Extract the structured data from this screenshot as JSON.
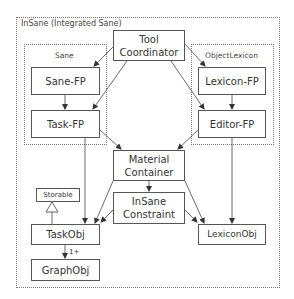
{
  "diagram": {
    "containers": {
      "outer": {
        "label": "InSane (Integrated Sane)"
      },
      "sane": {
        "label": "Sane"
      },
      "object_lexicon": {
        "label": "ObjectLexicon"
      }
    },
    "nodes": {
      "tool_coordinator": {
        "line1": "Tool",
        "line2": "Coordinator"
      },
      "sane_fp": {
        "label": "Sane-FP"
      },
      "task_fp": {
        "label": "Task-FP"
      },
      "lexicon_fp": {
        "label": "Lexicon-FP"
      },
      "editor_fp": {
        "label": "Editor-FP"
      },
      "material_container": {
        "line1": "Material",
        "line2": "Container"
      },
      "insane_constraint": {
        "line1": "InSane",
        "line2": "Constraint"
      },
      "storable": {
        "label": "Storable"
      },
      "task_obj": {
        "label": "TaskObj"
      },
      "graph_obj": {
        "label": "GraphObj"
      },
      "lexicon_obj": {
        "label": "LexiconObj"
      }
    },
    "edges": [
      {
        "from": "Tool Coordinator",
        "to": "Sane-FP"
      },
      {
        "from": "Tool Coordinator",
        "to": "Task-FP"
      },
      {
        "from": "Tool Coordinator",
        "to": "Lexicon-FP"
      },
      {
        "from": "Tool Coordinator",
        "to": "Editor-FP"
      },
      {
        "from": "Sane-FP",
        "to": "Task-FP"
      },
      {
        "from": "Lexicon-FP",
        "to": "Editor-FP"
      },
      {
        "from": "Task-FP",
        "to": "Material Container"
      },
      {
        "from": "Editor-FP",
        "to": "Material Container"
      },
      {
        "from": "Task-FP",
        "to": "TaskObj"
      },
      {
        "from": "Editor-FP",
        "to": "LexiconObj"
      },
      {
        "from": "Material Container",
        "to": "InSane Constraint"
      },
      {
        "from": "Material Container",
        "to": "TaskObj"
      },
      {
        "from": "Material Container",
        "to": "LexiconObj"
      },
      {
        "from": "InSane Constraint",
        "to": "TaskObj"
      },
      {
        "from": "InSane Constraint",
        "to": "LexiconObj"
      },
      {
        "from": "TaskObj",
        "to": "Storable",
        "type": "inheritance"
      },
      {
        "from": "TaskObj",
        "to": "GraphObj",
        "multiplicity": "1+"
      }
    ],
    "multiplicity_label": "1+"
  }
}
